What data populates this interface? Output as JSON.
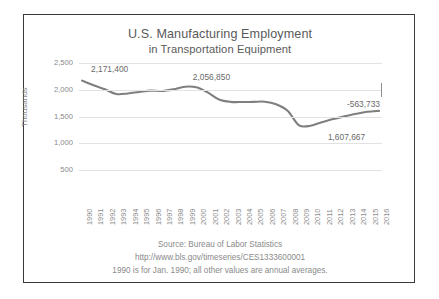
{
  "chart_data": {
    "type": "line",
    "title": "U.S. Manufacturing Employment",
    "subtitle": "in Transportation Equipment",
    "xlabel": "",
    "ylabel": "Thousands",
    "ylim": [
      0,
      2500
    ],
    "yticks": [
      "500",
      "1,000",
      "1,500",
      "2,000",
      "2,500"
    ],
    "ytick_values": [
      500,
      1000,
      1500,
      2000,
      2500
    ],
    "grid": true,
    "legend": "none",
    "line_color": "#7f7f7f",
    "categories": [
      "1990",
      "1991",
      "1992",
      "1993",
      "1994",
      "1995",
      "1996",
      "1997",
      "1998",
      "1999",
      "2000",
      "2001",
      "2002",
      "2003",
      "2004",
      "2005",
      "2006",
      "2007",
      "2008",
      "2009",
      "2010",
      "2011",
      "2012",
      "2013",
      "2014",
      "2015",
      "2016"
    ],
    "values": [
      2171.4,
      2085,
      2010,
      1922,
      1932,
      1960,
      1985,
      1978,
      2008,
      2056.85,
      2048,
      1952,
      1820,
      1775,
      1772,
      1775,
      1778,
      1730,
      1610,
      1337,
      1330,
      1395,
      1455,
      1505,
      1552,
      1590,
      1607.667
    ],
    "annotations": [
      {
        "name": "start-value-label",
        "text": "2,171,400",
        "year": "1990"
      },
      {
        "name": "peak-value-label",
        "text": "2,056,850",
        "year": "1999"
      },
      {
        "name": "net-change-label",
        "text": "-563,733"
      },
      {
        "name": "end-value-label",
        "text": "1,607,667",
        "year": "2016"
      }
    ]
  },
  "footer": {
    "line1": "Source: Bureau of Labor Statistics",
    "line2": "http://www.bls.gov/timeseries/CES1333600001",
    "line3": "1990 is for Jan. 1990; all other values are annual averages."
  }
}
